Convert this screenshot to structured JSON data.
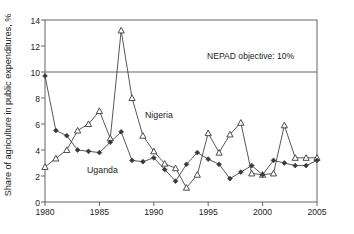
{
  "chart_data": {
    "type": "line",
    "title": "",
    "subtitle": "",
    "xlabel": "",
    "ylabel": "Share of agriculture in public expenditures, %",
    "xlim": [
      1980,
      2005
    ],
    "ylim": [
      0,
      14
    ],
    "xticks": [
      1980,
      1985,
      1990,
      1995,
      2000,
      2005
    ],
    "yticks": [
      0,
      2,
      4,
      6,
      8,
      10,
      12,
      14
    ],
    "grid": false,
    "legend_position": "inline-annotations",
    "x": [
      1980,
      1981,
      1982,
      1983,
      1984,
      1985,
      1986,
      1987,
      1988,
      1989,
      1990,
      1991,
      1992,
      1993,
      1994,
      1995,
      1996,
      1997,
      1998,
      1999,
      2000,
      2001,
      2002,
      2003,
      2004,
      2005
    ],
    "series": [
      {
        "name": "Nigeria",
        "marker": "triangle",
        "color": "#3a3a3a",
        "values": [
          2.7,
          3.35,
          4.0,
          5.5,
          6.0,
          7.0,
          4.9,
          13.2,
          8.0,
          5.1,
          3.9,
          2.95,
          2.6,
          1.1,
          2.1,
          5.3,
          3.8,
          5.2,
          6.1,
          2.2,
          2.1,
          2.2,
          5.9,
          3.4,
          3.4,
          3.4
        ]
      },
      {
        "name": "Uganda",
        "marker": "diamond",
        "color": "#3a3a3a",
        "values": [
          9.7,
          5.5,
          5.1,
          4.0,
          3.9,
          3.8,
          4.6,
          5.4,
          3.2,
          3.1,
          3.4,
          2.5,
          1.6,
          2.9,
          3.8,
          3.3,
          2.9,
          1.8,
          2.3,
          2.8,
          2.1,
          3.2,
          3.0,
          2.8,
          2.8,
          3.2
        ]
      }
    ],
    "annotations": [
      {
        "name": "nepad-objective-line",
        "text": "NEPAD objective: 10%",
        "value": 10,
        "x_text": 1997.4
      },
      {
        "name": "nigeria-series-label",
        "text": "Nigeria",
        "x": 1990.5,
        "y": 6.6
      },
      {
        "name": "uganda-series-label",
        "text": "Uganda",
        "x": 1986.0,
        "y": 2.55
      }
    ]
  },
  "axis": {
    "y_tick_labels": [
      "0",
      "2",
      "4",
      "6",
      "8",
      "10",
      "12",
      "14"
    ],
    "x_tick_labels": [
      "1980",
      "1985",
      "1990",
      "1995",
      "2000",
      "2005"
    ],
    "y_axis_title": "Share of agriculture in public expenditures, %"
  },
  "labels": {
    "nigeria": "Nigeria",
    "uganda": "Uganda",
    "nepad": "NEPAD objective: 10%"
  }
}
